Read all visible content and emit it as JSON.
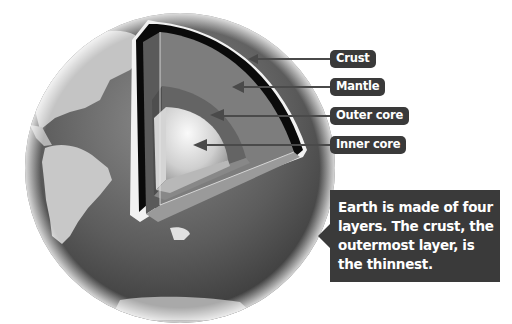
{
  "diagram": {
    "labels": [
      {
        "id": "crust",
        "text": "Crust"
      },
      {
        "id": "mantle",
        "text": "Mantle"
      },
      {
        "id": "outer_core",
        "text": "Outer core"
      },
      {
        "id": "inner_core",
        "text": "Inner core"
      }
    ],
    "callout": {
      "text": "Earth is made of four layers. The crust, the outermost layer, is the thinnest."
    }
  },
  "colors": {
    "background": "#ffffff",
    "label_bg": "#3a3a3a",
    "label_text": "#ffffff",
    "callout_bg": "#3a3a3a",
    "ocean": "#5a5a5a",
    "land": "#bdbdbd",
    "crust": "#0a0a0a",
    "mantle": "#7a7a7a",
    "outer_core": "#636363",
    "inner_core": "#e6e6e6",
    "arrow": "#4a4a4a"
  }
}
